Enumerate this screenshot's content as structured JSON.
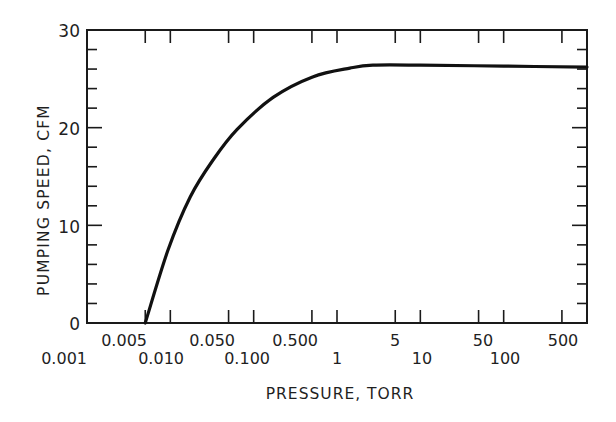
{
  "chart_data": {
    "type": "line",
    "title": "",
    "xlabel": "PRESSURE, TORR",
    "ylabel": "PUMPING SPEED, CFM",
    "xscale": "log",
    "xlim": [
      0.001,
      1000
    ],
    "ylim": [
      0,
      30
    ],
    "grid": false,
    "legend": null,
    "y_ticks": [
      0,
      10,
      20,
      30
    ],
    "y_minor_step": 2,
    "x_ticks_upper_row": [
      "0.005",
      "0.050",
      "0.500",
      "5",
      "50",
      "500"
    ],
    "x_ticks_lower_row": [
      "0.001",
      "0.010",
      "0.100",
      "1",
      "10",
      "100"
    ],
    "series": [
      {
        "name": "Pumping speed",
        "x": [
          0.005,
          0.0094,
          0.0173,
          0.0326,
          0.063,
          0.171,
          0.51,
          1.43,
          2.7,
          10,
          100,
          1000
        ],
        "y": [
          0,
          7.5,
          12.9,
          16.7,
          19.8,
          23.1,
          25.2,
          26.1,
          26.4,
          26.4,
          26.3,
          26.2
        ]
      }
    ]
  },
  "axes": {
    "ylabel": "PUMPING SPEED, CFM",
    "xlabel": "PRESSURE, TORR",
    "y_tick_labels": [
      "0",
      "10",
      "20",
      "30"
    ],
    "x_upper_labels": [
      "0.005",
      "0.050",
      "0.500",
      "5",
      "50",
      "500"
    ],
    "x_lower_labels": [
      "0.001",
      "0.010",
      "0.100",
      "1",
      "10",
      "100"
    ]
  },
  "colors": {
    "line": "#111111",
    "axis": "#1a1a1a",
    "background": "#ffffff"
  }
}
